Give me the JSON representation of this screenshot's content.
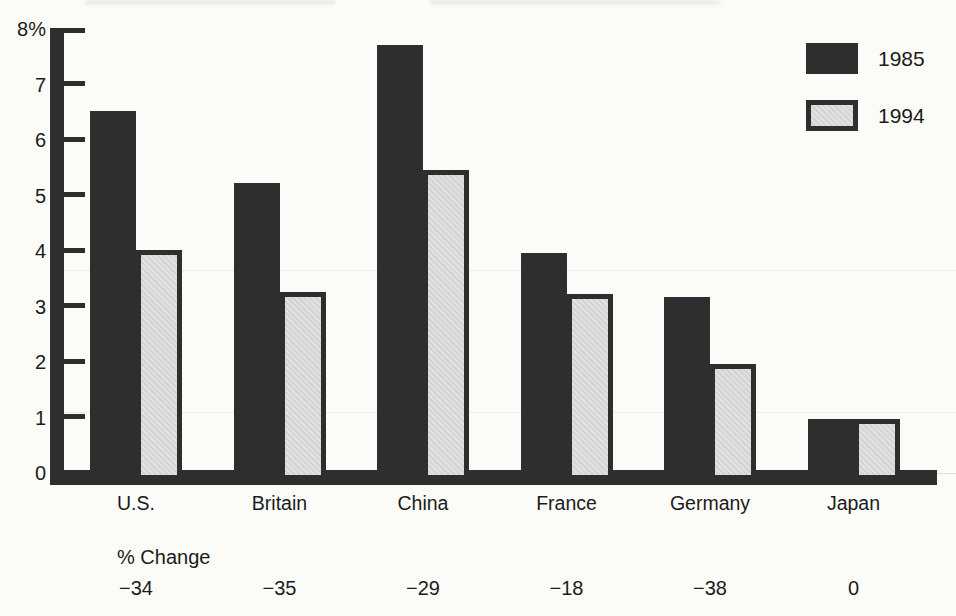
{
  "chart_data": {
    "type": "bar",
    "title": "",
    "categories": [
      "U.S.",
      "Britain",
      "China",
      "France",
      "Germany",
      "Japan"
    ],
    "series": [
      {
        "name": "1985",
        "values": [
          6.5,
          5.2,
          7.7,
          3.95,
          3.15,
          0.95
        ]
      },
      {
        "name": "1994",
        "values": [
          4.0,
          3.25,
          5.45,
          3.2,
          1.95,
          0.95
        ]
      }
    ],
    "yticks": [
      {
        "value": 0,
        "label": "0"
      },
      {
        "value": 1,
        "label": "1"
      },
      {
        "value": 2,
        "label": "2"
      },
      {
        "value": 3,
        "label": "3"
      },
      {
        "value": 4,
        "label": "4"
      },
      {
        "value": 5,
        "label": "5"
      },
      {
        "value": 6,
        "label": "6"
      },
      {
        "value": 7,
        "label": "7"
      },
      {
        "value": 8,
        "label": "8%"
      }
    ],
    "ylim": [
      0,
      8
    ],
    "grid": false,
    "legend_position": "top-right",
    "pct_change_label": "% Change",
    "pct_change": [
      "−34",
      "−35",
      "−29",
      "−18",
      "−38",
      "0"
    ]
  },
  "colors": {
    "bar_dark": "#2e2e2e",
    "bar_light_fill": "#dcdcdc",
    "background": "#fbfbf8",
    "text": "#1b1b1b"
  }
}
